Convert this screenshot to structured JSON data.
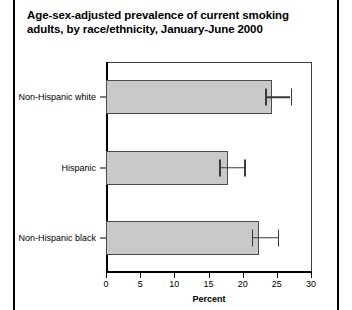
{
  "chart_data": {
    "type": "bar",
    "orientation": "horizontal",
    "title": "Age-sex-adjusted prevalence of current smoking adults, by race/ethnicity, January-June 2000",
    "xlabel": "Percent",
    "ylabel": "",
    "xlim": [
      0,
      30
    ],
    "xticks": [
      0,
      5,
      10,
      15,
      20,
      25,
      30
    ],
    "xticklabels": [
      "0",
      "5",
      "10",
      "15",
      "20",
      "25",
      "30"
    ],
    "grid": false,
    "legend": false,
    "categories": [
      "Non-Hispanic white",
      "Hispanic",
      "Non-Hispanic black"
    ],
    "values": [
      24.3,
      17.9,
      22.4
    ],
    "error_low": [
      23.3,
      16.6,
      21.3
    ],
    "error_high": [
      27.0,
      20.2,
      25.1
    ],
    "series": [
      {
        "name": "Current smoking prevalence",
        "values": [
          24.3,
          17.9,
          22.4
        ]
      }
    ],
    "bar_color": "#c9c9c9",
    "bar_edge_color": "#4a4a4a",
    "error_color": "#3a3a3a"
  },
  "axis": {
    "x_title": "Percent"
  }
}
